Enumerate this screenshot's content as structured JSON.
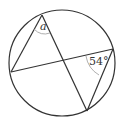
{
  "diagram": {
    "type": "circle-inscribed-angles",
    "circle": {
      "cx": 62,
      "cy": 63,
      "r": 53
    },
    "points": {
      "A": {
        "x": 42,
        "y": 15
      },
      "B": {
        "x": 11,
        "y": 72
      },
      "C": {
        "x": 113,
        "y": 49
      },
      "D": {
        "x": 87,
        "y": 111
      }
    },
    "segments": [
      [
        "A",
        "B"
      ],
      [
        "A",
        "D"
      ],
      [
        "B",
        "C"
      ],
      [
        "C",
        "D"
      ]
    ],
    "labels": {
      "angle_a": "a",
      "angle_c": "54°"
    },
    "colors": {
      "stroke": "#333333",
      "arc": "#999999"
    }
  }
}
